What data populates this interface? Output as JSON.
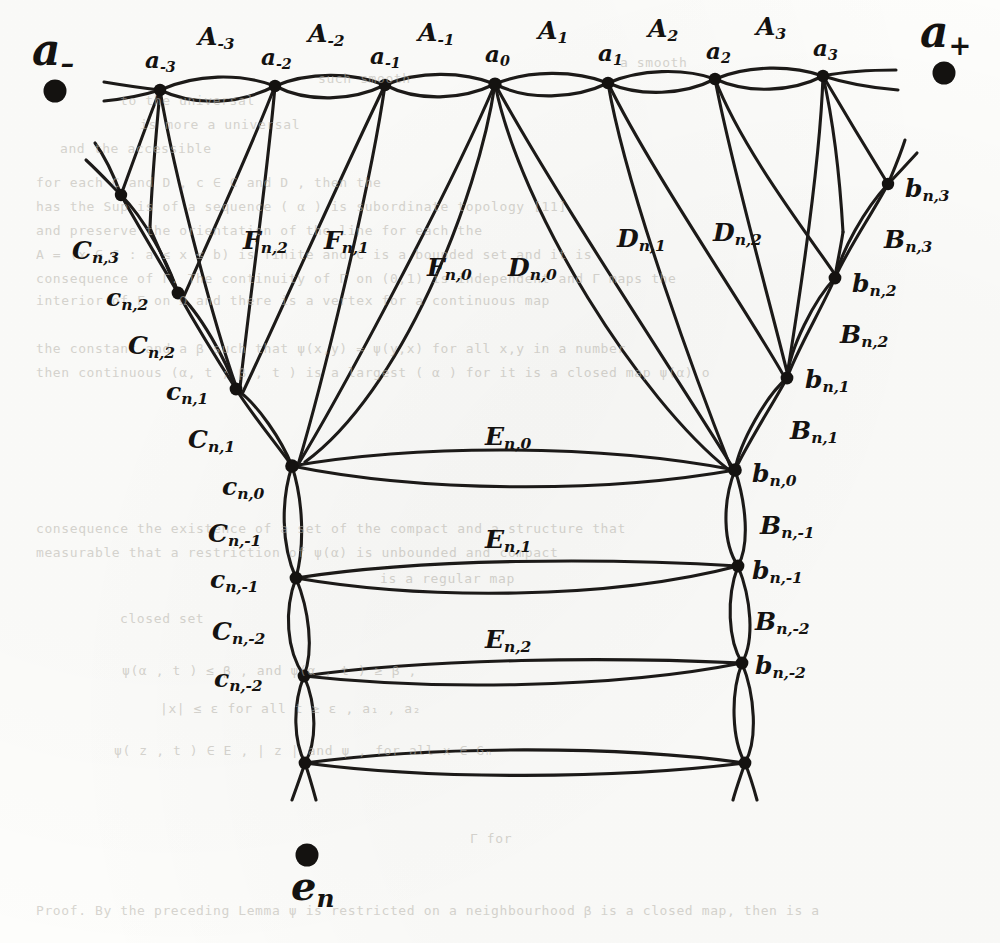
{
  "figure": {
    "kind": "graph-diagram",
    "background_color": "#fdfdfb",
    "ink_color": "#141210",
    "endpoints": {
      "left": {
        "label_base": "a",
        "label_sub": "–"
      },
      "right": {
        "label_base": "a",
        "label_sub": "+"
      },
      "bottom": {
        "label_base": "e",
        "label_sub": "n"
      }
    },
    "top_vertices": [
      {
        "base": "a",
        "sub": "-3"
      },
      {
        "base": "a",
        "sub": "-2"
      },
      {
        "base": "a",
        "sub": "-1"
      },
      {
        "base": "a",
        "sub": "0"
      },
      {
        "base": "a",
        "sub": "1"
      },
      {
        "base": "a",
        "sub": "2"
      },
      {
        "base": "a",
        "sub": "3"
      }
    ],
    "top_edges": [
      {
        "base": "A",
        "sub": "-3"
      },
      {
        "base": "A",
        "sub": "-2"
      },
      {
        "base": "A",
        "sub": "-1"
      },
      {
        "base": "A",
        "sub": "1"
      },
      {
        "base": "A",
        "sub": "2"
      },
      {
        "base": "A",
        "sub": "3"
      }
    ],
    "left_vertices": [
      {
        "base": "c",
        "sub": "n,2"
      },
      {
        "base": "c",
        "sub": "n,1"
      },
      {
        "base": "c",
        "sub": "n,0"
      },
      {
        "base": "c",
        "sub": "n,-1"
      },
      {
        "base": "c",
        "sub": "n,-2"
      }
    ],
    "left_edges": [
      {
        "base": "C",
        "sub": "n,3"
      },
      {
        "base": "C",
        "sub": "n,2"
      },
      {
        "base": "C",
        "sub": "n,1"
      },
      {
        "base": "C",
        "sub": "n,-1"
      },
      {
        "base": "C",
        "sub": "n,-2"
      }
    ],
    "right_vertices": [
      {
        "base": "b",
        "sub": "n,3"
      },
      {
        "base": "b",
        "sub": "n,2"
      },
      {
        "base": "b",
        "sub": "n,1"
      },
      {
        "base": "b",
        "sub": "n,0"
      },
      {
        "base": "b",
        "sub": "n,-1"
      },
      {
        "base": "b",
        "sub": "n,-2"
      }
    ],
    "right_edges": [
      {
        "base": "B",
        "sub": "n,3"
      },
      {
        "base": "B",
        "sub": "n,2"
      },
      {
        "base": "B",
        "sub": "n,1"
      },
      {
        "base": "B",
        "sub": "n,-1"
      },
      {
        "base": "B",
        "sub": "n,-2"
      }
    ],
    "middle_edges": [
      {
        "base": "E",
        "sub": "n,0"
      },
      {
        "base": "E",
        "sub": "n,1"
      },
      {
        "base": "E",
        "sub": "n,2"
      }
    ],
    "fan_left_edges": [
      {
        "base": "F",
        "sub": "n,2"
      },
      {
        "base": "F",
        "sub": "n,1"
      },
      {
        "base": "F",
        "sub": "n,0"
      }
    ],
    "fan_right_edges": [
      {
        "base": "D",
        "sub": "n,2"
      },
      {
        "base": "D",
        "sub": "n,1"
      },
      {
        "base": "D",
        "sub": "n,0"
      }
    ]
  },
  "labels": {
    "a_minus": {
      "base": "a",
      "sub": "–"
    },
    "a_plus": {
      "base": "a",
      "sub": "+"
    },
    "e_n": {
      "base": "e",
      "sub": "n"
    },
    "A_m3": {
      "base": "A",
      "sub": "-3"
    },
    "A_m2": {
      "base": "A",
      "sub": "-2"
    },
    "A_m1": {
      "base": "A",
      "sub": "-1"
    },
    "A_1": {
      "base": "A",
      "sub": "1"
    },
    "A_2": {
      "base": "A",
      "sub": "2"
    },
    "A_3": {
      "base": "A",
      "sub": "3"
    },
    "a_m3": {
      "base": "a",
      "sub": "-3"
    },
    "a_m2": {
      "base": "a",
      "sub": "-2"
    },
    "a_m1": {
      "base": "a",
      "sub": "-1"
    },
    "a_0": {
      "base": "a",
      "sub": "0"
    },
    "a_1": {
      "base": "a",
      "sub": "1"
    },
    "a_2": {
      "base": "a",
      "sub": "2"
    },
    "a_3": {
      "base": "a",
      "sub": "3"
    },
    "C_n3": {
      "base": "C",
      "sub": "n,3"
    },
    "c_n2": {
      "base": "c",
      "sub": "n,2"
    },
    "C_n2": {
      "base": "C",
      "sub": "n,2"
    },
    "c_n1": {
      "base": "c",
      "sub": "n,1"
    },
    "C_n1": {
      "base": "C",
      "sub": "n,1"
    },
    "c_n0": {
      "base": "c",
      "sub": "n,0"
    },
    "C_nm1": {
      "base": "C",
      "sub": "n,-1"
    },
    "c_nm1": {
      "base": "c",
      "sub": "n,-1"
    },
    "C_nm2": {
      "base": "C",
      "sub": "n,-2"
    },
    "c_nm2": {
      "base": "c",
      "sub": "n,-2"
    },
    "b_n3": {
      "base": "b",
      "sub": "n,3"
    },
    "B_n3": {
      "base": "B",
      "sub": "n,3"
    },
    "b_n2": {
      "base": "b",
      "sub": "n,2"
    },
    "B_n2": {
      "base": "B",
      "sub": "n,2"
    },
    "b_n1": {
      "base": "b",
      "sub": "n,1"
    },
    "B_n1": {
      "base": "B",
      "sub": "n,1"
    },
    "b_n0": {
      "base": "b",
      "sub": "n,0"
    },
    "B_nm1": {
      "base": "B",
      "sub": "n,-1"
    },
    "b_nm1": {
      "base": "b",
      "sub": "n,-1"
    },
    "B_nm2": {
      "base": "B",
      "sub": "n,-2"
    },
    "b_nm2": {
      "base": "b",
      "sub": "n,-2"
    },
    "E_n0": {
      "base": "E",
      "sub": "n,0"
    },
    "E_n1": {
      "base": "E",
      "sub": "n,1"
    },
    "E_n2": {
      "base": "E",
      "sub": "n,2"
    },
    "F_n2": {
      "base": "F",
      "sub": "n,2"
    },
    "F_n1": {
      "base": "F",
      "sub": "n,1"
    },
    "F_n0": {
      "base": "F",
      "sub": "n,0"
    },
    "D_n2": {
      "base": "D",
      "sub": "n,2"
    },
    "D_n1": {
      "base": "D",
      "sub": "n,1"
    },
    "D_n0": {
      "base": "D",
      "sub": "n,0"
    }
  },
  "bleed_through": [
    {
      "text": "a smooth",
      "x": 620,
      "y": 62
    },
    {
      "text": "to the universal",
      "x": 120,
      "y": 100
    },
    {
      "text": "such smooth",
      "x": 318,
      "y": 78
    },
    {
      "text": "is more a universal",
      "x": 140,
      "y": 124
    },
    {
      "text": "and the accessible",
      "x": 60,
      "y": 148
    },
    {
      "text": "for each  C  and  D , c ∈ C and D , then the",
      "x": 36,
      "y": 182
    },
    {
      "text": "has the  Sup   is of a sequence ( α ) is subordinate topology  [11]",
      "x": 36,
      "y": 206
    },
    {
      "text": "and  preserve  the orientation  of  the  line  for each  the",
      "x": 36,
      "y": 230
    },
    {
      "text": "A = (x ∈ C : a ≤ x ≤ b)  is  finite  and  C is a  bounded  set  and  it is",
      "x": 36,
      "y": 254
    },
    {
      "text": "consequence of  Γ. The  continuity  of  Γ on  (0,1)  is  independent  and  Γ  maps the",
      "x": 36,
      "y": 278
    },
    {
      "text": "interior of  Γ on  Ω and there  is a  vertex  for  a  continuous  map",
      "x": 36,
      "y": 300
    },
    {
      "text": "the  constant  and  a  β  such  that  ψ(x,y) = ψ(y,x)  for all  x,y  in  a  number",
      "x": 36,
      "y": 348
    },
    {
      "text": "then  continuous  (α, t ; β , t ) is a  largest  ( α )  for  it  is  a  closed  map ψ(α)  o",
      "x": 36,
      "y": 372
    },
    {
      "text": "consequence  the  existence  of  a  set of  the  compact  and  a  structure  that",
      "x": 36,
      "y": 528
    },
    {
      "text": "measurable  that  a  restriction  of  ψ(α)  is  unbounded  and  compact",
      "x": 36,
      "y": 552
    },
    {
      "text": "is  a  regular  map",
      "x": 380,
      "y": 578
    },
    {
      "text": "closed  set",
      "x": 120,
      "y": 618
    },
    {
      "text": "ψ(α , t )  ≤  β , and  ψ(α , t )  ≥  β ,",
      "x": 122,
      "y": 670
    },
    {
      "text": "|x|  ≤  ε   for  all  t  ≥  ε ,  a₁ ,  a₂",
      "x": 160,
      "y": 708
    },
    {
      "text": "ψ( z , t )  ∈  E  ,  ∣ z ∣  and  ψ ,     for  all  x  ∈ Gₙ",
      "x": 114,
      "y": 750
    },
    {
      "text": "Proof.  By  the  preceding  Lemma  ψ  is  restricted  on  a  neighbourhood  β  is a  closed  map,  then  is  a",
      "x": 36,
      "y": 810
    },
    {
      "text": "Γ   for",
      "x": 470,
      "y": 838
    }
  ]
}
